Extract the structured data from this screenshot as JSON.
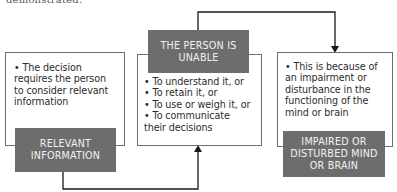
{
  "header_fragment": "demonstrated.",
  "boxes": [
    {
      "id": "relevant-information",
      "label_lines": [
        "RELEVANT",
        "INFORMATION"
      ],
      "text_lines": [
        "• The decision",
        "requires the person",
        "to consider relevant",
        "information"
      ]
    },
    {
      "id": "person-unable",
      "label_lines": [
        "THE PERSON IS",
        "UNABLE"
      ],
      "text_lines": [
        "• To understand it, or",
        "• To retain it, or",
        "• To use or weigh it, or",
        "• To communicate",
        "their decisions"
      ]
    },
    {
      "id": "impaired-mind",
      "label_lines": [
        "IMPAIRED OR",
        "DISTURBED MIND",
        "OR BRAIN"
      ],
      "text_lines": [
        "• This is because of",
        "an impairment or",
        "disturbance in the",
        "functioning of the",
        "mind or brain"
      ]
    }
  ],
  "colors": {
    "label_bg": "#6d6d6d",
    "label_text": "#f1f1f1",
    "border": "#6e6e6e",
    "connector": "#1a1a1a"
  }
}
